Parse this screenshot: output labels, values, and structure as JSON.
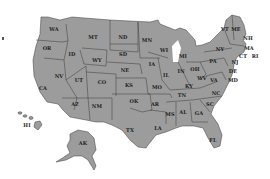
{
  "map": {
    "title": "United States",
    "fill_color": "#9c9c9c",
    "border_color": "#3a3a3a",
    "label_color": "#1e1e1e",
    "background": "#ffffff",
    "states": [
      {
        "abbr": "WA",
        "x": 54,
        "y": 29
      },
      {
        "abbr": "OR",
        "x": 47,
        "y": 48
      },
      {
        "abbr": "CA",
        "x": 43,
        "y": 88
      },
      {
        "abbr": "ID",
        "x": 72,
        "y": 54
      },
      {
        "abbr": "NV",
        "x": 59,
        "y": 76
      },
      {
        "abbr": "MT",
        "x": 93,
        "y": 37
      },
      {
        "abbr": "WY",
        "x": 97,
        "y": 60
      },
      {
        "abbr": "UT",
        "x": 79,
        "y": 80
      },
      {
        "abbr": "AZ",
        "x": 75,
        "y": 104
      },
      {
        "abbr": "CO",
        "x": 102,
        "y": 82
      },
      {
        "abbr": "NM",
        "x": 97,
        "y": 106
      },
      {
        "abbr": "ND",
        "x": 123,
        "y": 37
      },
      {
        "abbr": "SD",
        "x": 123,
        "y": 54
      },
      {
        "abbr": "NE",
        "x": 125,
        "y": 70
      },
      {
        "abbr": "KS",
        "x": 129,
        "y": 85
      },
      {
        "abbr": "OK",
        "x": 134,
        "y": 101
      },
      {
        "abbr": "TX",
        "x": 130,
        "y": 130
      },
      {
        "abbr": "MN",
        "x": 147,
        "y": 40
      },
      {
        "abbr": "IA",
        "x": 152,
        "y": 64
      },
      {
        "abbr": "MO",
        "x": 157,
        "y": 87
      },
      {
        "abbr": "AR",
        "x": 155,
        "y": 104
      },
      {
        "abbr": "LA",
        "x": 158,
        "y": 128
      },
      {
        "abbr": "WI",
        "x": 164,
        "y": 50
      },
      {
        "abbr": "IL",
        "x": 166,
        "y": 75
      },
      {
        "abbr": "MS",
        "x": 170,
        "y": 114
      },
      {
        "abbr": "MI",
        "x": 183,
        "y": 56
      },
      {
        "abbr": "IN",
        "x": 181,
        "y": 71
      },
      {
        "abbr": "OH",
        "x": 195,
        "y": 69
      },
      {
        "abbr": "KY",
        "x": 189,
        "y": 86
      },
      {
        "abbr": "TN",
        "x": 182,
        "y": 95
      },
      {
        "abbr": "AL",
        "x": 183,
        "y": 112
      },
      {
        "abbr": "GA",
        "x": 199,
        "y": 113
      },
      {
        "abbr": "FL",
        "x": 213,
        "y": 140
      },
      {
        "abbr": "WV",
        "x": 202,
        "y": 78
      },
      {
        "abbr": "VA",
        "x": 214,
        "y": 80
      },
      {
        "abbr": "NC",
        "x": 216,
        "y": 93
      },
      {
        "abbr": "SC",
        "x": 210,
        "y": 104
      },
      {
        "abbr": "PA",
        "x": 213,
        "y": 61
      },
      {
        "abbr": "NY",
        "x": 220,
        "y": 49
      },
      {
        "abbr": "VT",
        "x": 225,
        "y": 29
      },
      {
        "abbr": "ME",
        "x": 236,
        "y": 29
      },
      {
        "abbr": "NH",
        "x": 248,
        "y": 38
      },
      {
        "abbr": "MA",
        "x": 249,
        "y": 48
      },
      {
        "abbr": "CT",
        "x": 243,
        "y": 56
      },
      {
        "abbr": "RI",
        "x": 255,
        "y": 56
      },
      {
        "abbr": "NJ",
        "x": 235,
        "y": 62
      },
      {
        "abbr": "DE",
        "x": 233,
        "y": 71
      },
      {
        "abbr": "MD",
        "x": 233,
        "y": 80
      },
      {
        "abbr": "HI",
        "x": 27,
        "y": 125
      },
      {
        "abbr": "AK",
        "x": 83,
        "y": 143
      }
    ]
  }
}
